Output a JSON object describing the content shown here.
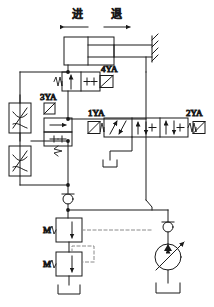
{
  "diagram": {
    "stroke_color": "#1a1a1a",
    "background_color": "#ffffff",
    "dash_color": "#888888",
    "direction_labels": [
      {
        "text": "进",
        "meaning": "advance"
      },
      {
        "text": "退",
        "meaning": "retract"
      }
    ],
    "solenoid_labels": [
      {
        "id": "4YA",
        "text": "4YA"
      },
      {
        "id": "3YA",
        "text": "3YA"
      },
      {
        "id": "1YA",
        "text": "1YA"
      },
      {
        "id": "2YA",
        "text": "2YA"
      }
    ],
    "port_labels": [
      {
        "id": "m1",
        "text": "M"
      },
      {
        "id": "m2",
        "text": "M"
      }
    ],
    "components": [
      {
        "name": "double-acting-cylinder",
        "count": 1
      },
      {
        "name": "directional-control-valve-4way-3position",
        "count": 1
      },
      {
        "name": "solenoid-valve-4ya",
        "count": 1
      },
      {
        "name": "solenoid-valve-3ya",
        "count": 1
      },
      {
        "name": "throttle-valve",
        "count": 2
      },
      {
        "name": "check-valve",
        "count": 2
      },
      {
        "name": "relief-valve",
        "count": 2
      },
      {
        "name": "variable-displacement-pump",
        "count": 1
      },
      {
        "name": "reservoir-tank",
        "count": 2
      }
    ]
  }
}
